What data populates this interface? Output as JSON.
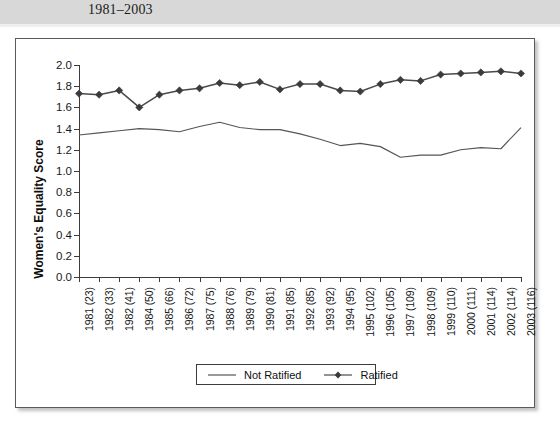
{
  "caption": {
    "text": "1981–2003"
  },
  "chart_data": {
    "type": "line",
    "title": "",
    "xlabel": "",
    "ylabel": "Women's Equality Score",
    "ylim": [
      0.0,
      2.0
    ],
    "ytick_step": 0.2,
    "grid": false,
    "legend_position": "bottom-center",
    "categories": [
      "1981 (23)",
      "1982 (33)",
      "1982 (41)",
      "1984 (50)",
      "1985 (66)",
      "1986 (72)",
      "1987 (75)",
      "1988 (76)",
      "1989 (79)",
      "1990 (81)",
      "1991 (85)",
      "1992 (85)",
      "1993 (92)",
      "1994 (95)",
      "1995 (102)",
      "1996 (105)",
      "1997 (109)",
      "1998 (109)",
      "1999 (110)",
      "2000 (111)",
      "2001 (114)",
      "2002 (114)",
      "2003 (116)"
    ],
    "yticks": [
      "0.0",
      "0.2",
      "0.4",
      "0.6",
      "0.8",
      "1.0",
      "1.2",
      "1.4",
      "1.6",
      "1.8",
      "2.0"
    ],
    "series": [
      {
        "name": "Not Ratified",
        "marker": "none",
        "color": "#555555",
        "values": [
          1.34,
          1.36,
          1.38,
          1.4,
          1.39,
          1.37,
          1.42,
          1.46,
          1.41,
          1.39,
          1.39,
          1.35,
          1.3,
          1.24,
          1.26,
          1.23,
          1.13,
          1.15,
          1.15,
          1.2,
          1.22,
          1.21,
          1.41
        ]
      },
      {
        "name": "Ratified",
        "marker": "diamond",
        "color": "#3b3b3b",
        "values": [
          1.73,
          1.72,
          1.76,
          1.6,
          1.72,
          1.76,
          1.78,
          1.83,
          1.81,
          1.84,
          1.77,
          1.82,
          1.82,
          1.76,
          1.75,
          1.82,
          1.86,
          1.85,
          1.91,
          1.92,
          1.93,
          1.94,
          1.92
        ]
      }
    ]
  },
  "legend": {
    "entries": [
      {
        "label": "Not Ratified"
      },
      {
        "label": "Ratified"
      }
    ]
  }
}
